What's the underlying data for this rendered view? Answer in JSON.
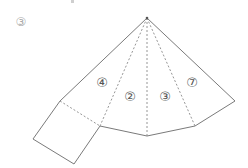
{
  "problem": {
    "number_label": "③"
  },
  "net": {
    "description": "Net of a pyramid: four triangular faces sharing an apex plus one square base",
    "faces": [
      {
        "id": "face-4",
        "label": "④"
      },
      {
        "id": "face-2",
        "label": "②"
      },
      {
        "id": "face-3",
        "label": "③"
      },
      {
        "id": "face-7",
        "label": "⑦"
      }
    ],
    "base": {
      "shape": "square"
    }
  },
  "colors": {
    "line": "#7a7a7a",
    "fold_line": "#8a8a8a",
    "label": "#555555",
    "background": "#ffffff"
  }
}
